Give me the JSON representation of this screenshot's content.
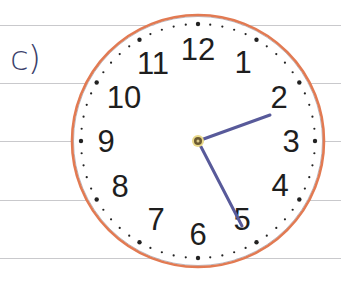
{
  "exercise": {
    "label": "c)"
  },
  "ruled_lines_y": [
    25,
    83,
    141,
    200,
    258
  ],
  "clock": {
    "center": [
      198,
      141
    ],
    "radius": 126,
    "rim_color": "#e27a52",
    "hand_color": "#585a9a",
    "numbers": [
      "12",
      "1",
      "2",
      "3",
      "4",
      "5",
      "6",
      "7",
      "8",
      "9",
      "10",
      "11"
    ],
    "hour_hand_end": [
      270,
      115
    ],
    "minute_hand_end": [
      242,
      226
    ],
    "time_shown": "2:25"
  }
}
